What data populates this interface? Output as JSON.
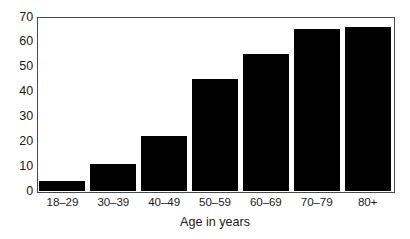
{
  "chart_data": {
    "type": "bar",
    "title": "",
    "subtitle": "",
    "xlabel": "Age in years",
    "ylabel": "",
    "categories": [
      "18–29",
      "30–39",
      "40–49",
      "50–59",
      "60–69",
      "70–79",
      "80+"
    ],
    "values": [
      4,
      11,
      22,
      45,
      55,
      65,
      66
    ],
    "series": [
      {
        "name": "",
        "values": [
          4,
          11,
          22,
          45,
          55,
          65,
          66
        ]
      }
    ],
    "ylim": [
      0,
      70
    ],
    "yticks": [
      0,
      10,
      20,
      30,
      40,
      50,
      60,
      70
    ],
    "ytick_labels": [
      "0",
      "10",
      "20",
      "30",
      "40",
      "50",
      "60",
      "70"
    ],
    "xtick_labels": [
      "18–29",
      "30–39",
      "40–49",
      "50–59",
      "60–69",
      "70–79",
      "80+"
    ],
    "grid": false,
    "legend": false,
    "legend_position": "none",
    "bar_color": "#000000",
    "axis_color": "#4a4a4a",
    "text_color": "#1a1a1a",
    "background_color": "#ffffff",
    "annotations": []
  }
}
